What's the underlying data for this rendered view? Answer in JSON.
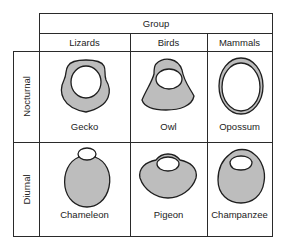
{
  "title": "Group",
  "columns": [
    "Lizards",
    "Birds",
    "Mammals"
  ],
  "rows": [
    {
      "label": "Nocturnal",
      "cells": [
        "Gecko",
        "Owl",
        "Opossum"
      ]
    },
    {
      "label": "Diurnal",
      "cells": [
        "Chameleon",
        "Pigeon",
        "Champanzee"
      ]
    }
  ],
  "colors": {
    "line": "#2a2a2a",
    "shading": "#bdbdbd",
    "background": "#ffffff"
  }
}
